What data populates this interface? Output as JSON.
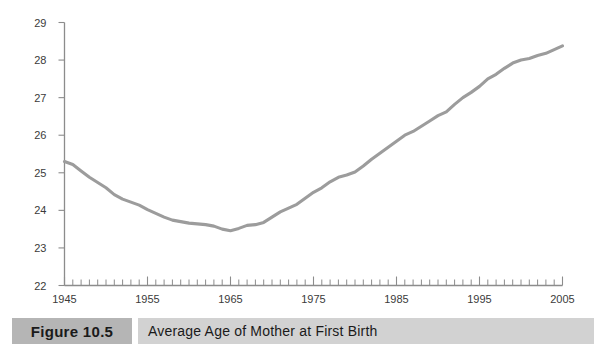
{
  "figure": {
    "number_label": "Figure 10.5",
    "caption": "Average Age of Mother at First Birth",
    "number_box_color": "#b5b5b5",
    "caption_box_color": "#d2d2d2"
  },
  "chart_data": {
    "type": "line",
    "title": "Average Age of Mother at First Birth",
    "xlabel": "",
    "ylabel": "",
    "grid": false,
    "legend": null,
    "line_color": "#9c9c9c",
    "axis_color": "#8c8c8c",
    "xlim": [
      1945,
      2005
    ],
    "ylim": [
      22,
      29
    ],
    "ytick_labels": [
      "29",
      "28",
      "27",
      "26",
      "25",
      "24",
      "23",
      "22"
    ],
    "yticks": [
      29,
      28,
      27,
      26,
      25,
      24,
      23,
      22
    ],
    "xtick_labels": [
      "1945",
      "1955",
      "1965",
      "1975",
      "1985",
      "1995",
      "2005"
    ],
    "xticks": [
      1945,
      1955,
      1965,
      1975,
      1985,
      1995,
      2005
    ],
    "x_minor_tick_interval": 1,
    "x": [
      1945,
      1946,
      1947,
      1948,
      1949,
      1950,
      1951,
      1952,
      1953,
      1954,
      1955,
      1956,
      1957,
      1958,
      1959,
      1960,
      1961,
      1962,
      1963,
      1964,
      1965,
      1966,
      1967,
      1968,
      1969,
      1970,
      1971,
      1972,
      1973,
      1974,
      1975,
      1976,
      1977,
      1978,
      1979,
      1980,
      1981,
      1982,
      1983,
      1984,
      1985,
      1986,
      1987,
      1988,
      1989,
      1990,
      1991,
      1992,
      1993,
      1994,
      1995,
      1996,
      1997,
      1998,
      1999,
      2000,
      2001,
      2002,
      2003,
      2004,
      2005
    ],
    "y": [
      25.3,
      25.22,
      25.05,
      24.88,
      24.74,
      24.6,
      24.42,
      24.3,
      24.22,
      24.14,
      24.02,
      23.92,
      23.82,
      23.74,
      23.7,
      23.66,
      23.64,
      23.62,
      23.58,
      23.5,
      23.46,
      23.52,
      23.6,
      23.62,
      23.68,
      23.82,
      23.96,
      24.06,
      24.16,
      24.32,
      24.48,
      24.6,
      24.76,
      24.88,
      24.94,
      25.02,
      25.18,
      25.36,
      25.52,
      25.68,
      25.84,
      26.0,
      26.1,
      26.24,
      26.38,
      26.52,
      26.62,
      26.82,
      27.0,
      27.14,
      27.3,
      27.5,
      27.62,
      27.78,
      27.92,
      28.0,
      28.04,
      28.12,
      28.18,
      28.28,
      28.38
    ]
  }
}
